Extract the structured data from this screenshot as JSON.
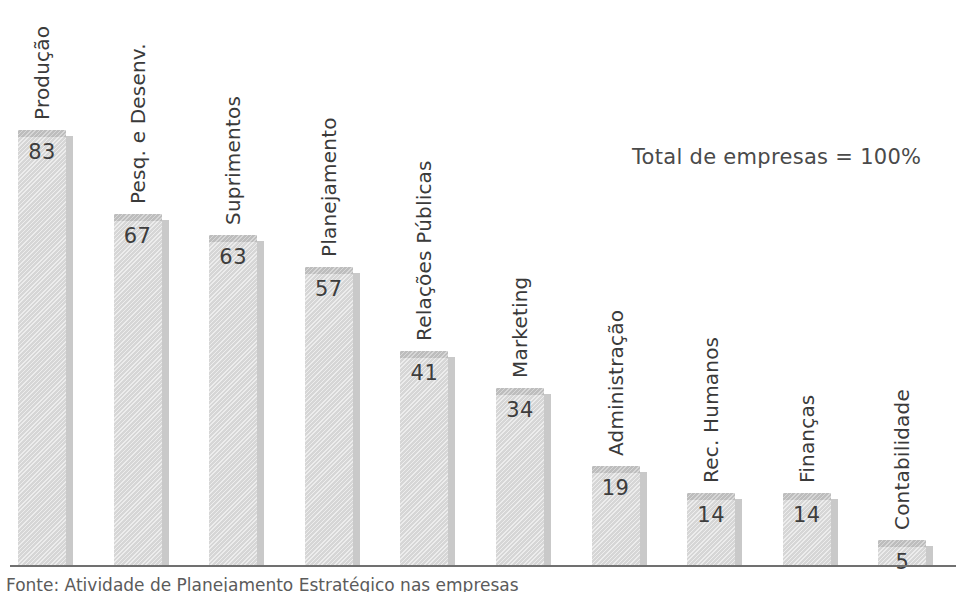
{
  "chart_data": {
    "type": "bar",
    "title": "",
    "subtitle": "",
    "xlabel": "",
    "ylabel": "",
    "grid": false,
    "legend": "none",
    "ylim": [
      0,
      100
    ],
    "value_suffix": "",
    "orientation": "vertical",
    "categories": [
      "Produção",
      "Pesq. e Desenv.",
      "Suprimentos",
      "Planejamento",
      "Relações Públicas",
      "Marketing",
      "Administração",
      "Rec. Humanos",
      "Finanças",
      "Contabilidade"
    ],
    "values": [
      83,
      67,
      63,
      57,
      41,
      34,
      19,
      14,
      14,
      5
    ],
    "bars": [
      {
        "label": "Produção",
        "value": 83
      },
      {
        "label": "Pesq. e Desenv.",
        "value": 67
      },
      {
        "label": "Suprimentos",
        "value": 63
      },
      {
        "label": "Planejamento",
        "value": 57
      },
      {
        "label": "Relações Públicas",
        "value": 41
      },
      {
        "label": "Marketing",
        "value": 34
      },
      {
        "label": "Administração",
        "value": 19
      },
      {
        "label": "Rec. Humanos",
        "value": 14
      },
      {
        "label": "Finanças",
        "value": 14
      },
      {
        "label": "Contabilidade",
        "value": 5
      }
    ],
    "annotations": [
      {
        "text": "Total de empresas = 100%"
      }
    ]
  },
  "annotation": {
    "text": "Total de empresas = 100%"
  },
  "source_note": {
    "text": "Fonte: Atividade de Planejamento Estratégico nas empresas"
  },
  "colors": {
    "bar_fill": "#d6d6d6",
    "bar_cap": "#bdbdbd",
    "bar_shadow": "#c9c9c9",
    "axis": "#707070",
    "text": "#3a3a3a"
  }
}
